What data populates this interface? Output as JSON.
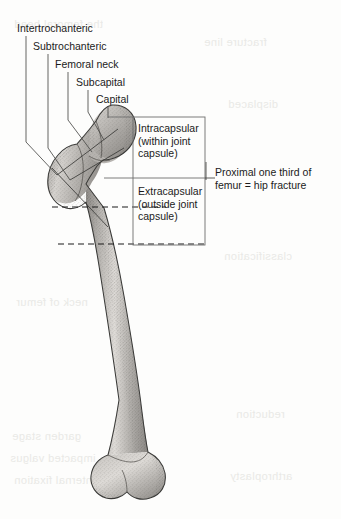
{
  "figure": {
    "background_color": "#fdfdfc",
    "ink_color": "#1b1b1b"
  },
  "callout_labels": [
    {
      "id": "intertrochanteric",
      "text": "Intertrochanteric",
      "x": 17,
      "y": 22,
      "leader_x": 26,
      "leader_top": 36,
      "leader_bend_y": 142,
      "leader_end_x": 57,
      "leader_end_y": 175
    },
    {
      "id": "subtrochanteric",
      "text": "Subtrochanteric",
      "x": 33,
      "y": 40,
      "leader_x": 48,
      "leader_top": 54,
      "leader_bend_y": 148,
      "leader_end_x": 70,
      "leader_end_y": 180
    },
    {
      "id": "femoral-neck",
      "text": "Femoral neck",
      "x": 55,
      "y": 58,
      "leader_x": 68,
      "leader_top": 72,
      "leader_bend_y": 120,
      "leader_end_x": 92,
      "leader_end_y": 152
    },
    {
      "id": "subcapital",
      "text": "Subcapital",
      "x": 76,
      "y": 76,
      "leader_x": 88,
      "leader_top": 90,
      "leader_bend_y": 112,
      "leader_end_x": 104,
      "leader_end_y": 140
    },
    {
      "id": "capital",
      "text": "Capital",
      "x": 96,
      "y": 93,
      "leader_x": 108,
      "leader_top": 106,
      "leader_bend_y": 106,
      "leader_end_x": 108,
      "leader_end_y": 118
    }
  ],
  "capsule_box": {
    "x": 133,
    "y": 117,
    "width": 72,
    "height": 128,
    "divider_y": 178,
    "border_color": "#6e6e6e",
    "intracapsular": {
      "text": "Intracapsular\n(within joint\ncapsule)",
      "x": 138,
      "y": 122
    },
    "extracapsular": {
      "text": "Extracapsular\n(outside joint\ncapsule)",
      "x": 138,
      "y": 185
    }
  },
  "right_callout": {
    "text": "Proximal one third of\nfemur = hip fracture",
    "x": 215,
    "y": 166,
    "tick_x": 205,
    "tick_y_top": 162,
    "tick_y_bottom": 180,
    "line_from_x": 205,
    "line_to_x": 215,
    "line_y": 178
  },
  "dashed_lines": [
    {
      "id": "intertrochanteric-line",
      "x1": 52,
      "x2": 166,
      "y": 207
    },
    {
      "id": "subtrochanteric-line",
      "x1": 58,
      "x2": 205,
      "y": 244
    }
  ],
  "bone": {
    "name": "femur",
    "fill_light": "#d8d6d2",
    "fill_mid": "#b3b0ac",
    "fill_dark": "#8d8a86",
    "outline": "#3a3a38",
    "head_center": {
      "x": 112,
      "y": 133
    },
    "greater_trochanter": {
      "x": 72,
      "y": 160
    },
    "shaft_top": {
      "x": 100,
      "y": 210
    },
    "shaft_bottom": {
      "x": 142,
      "y": 430
    },
    "distal_end": {
      "x": 140,
      "y": 495
    }
  },
  "ghost_text": [
    {
      "text": "the femoral head",
      "x": 14,
      "y": 18
    },
    {
      "text": "fracture line",
      "x": 204,
      "y": 36
    },
    {
      "text": "displaced",
      "x": 228,
      "y": 98
    },
    {
      "text": "neck of femur",
      "x": 16,
      "y": 296
    },
    {
      "text": "classification",
      "x": 224,
      "y": 250
    },
    {
      "text": "garden stage",
      "x": 12,
      "y": 430
    },
    {
      "text": "impacted valgus",
      "x": 10,
      "y": 452
    },
    {
      "text": "reduction",
      "x": 236,
      "y": 408
    },
    {
      "text": "internal fixation",
      "x": 14,
      "y": 474
    },
    {
      "text": "arthroplasty",
      "x": 230,
      "y": 470
    }
  ]
}
